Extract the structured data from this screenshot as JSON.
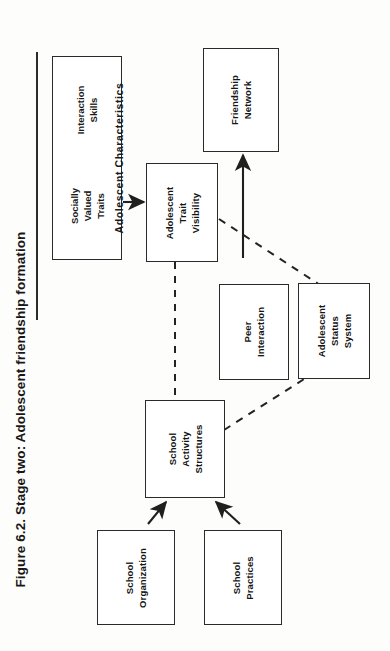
{
  "figure": {
    "caption": "Figure 6.2.   Stage two: Adolescent friendship formation",
    "orientation": "rotated-90-ccw",
    "page_width": 390,
    "page_height": 651,
    "ink_color": "#2a2a2a",
    "paper_color": "#fdfdfc"
  },
  "nodes": {
    "characteristics": {
      "header": "Adolescent Characteristics",
      "sub_a": "Socially\nValued\nTraits",
      "sub_a_lines": [
        "Socially",
        "Valued",
        "Traits"
      ],
      "sub_b": "Interaction\nSkills",
      "sub_b_lines": [
        "Interaction",
        "Skills"
      ]
    },
    "trait_visibility": {
      "label": "Adolescent\nTrait\nVisibility",
      "lines": [
        "Adolescent",
        "Trait",
        "Visibility"
      ]
    },
    "friendship_network": {
      "label": "Friendship\nNetwork",
      "lines": [
        "Friendship",
        "Network"
      ]
    },
    "peer_interaction": {
      "label": "Peer\nInteraction",
      "lines": [
        "Peer",
        "Interaction"
      ]
    },
    "status_system": {
      "label": "Adolescent\nStatus\nSystem",
      "lines": [
        "Adolescent",
        "Status",
        "System"
      ]
    },
    "activity_structures": {
      "label": "School\nActivity\nStructures",
      "lines": [
        "School",
        "Activity",
        "Structures"
      ]
    },
    "school_organization": {
      "label": "School\nOrganization",
      "lines": [
        "School",
        "Organization"
      ]
    },
    "school_practices": {
      "label": "School\nPractices",
      "lines": [
        "School",
        "Practices"
      ]
    }
  },
  "edges": [
    {
      "id": "char-to-trait",
      "from": "characteristics",
      "to": "trait_visibility",
      "style": "solid",
      "arrow": "single"
    },
    {
      "id": "peer-to-friendship",
      "from": "peer_interaction",
      "to": "friendship_network",
      "style": "solid",
      "arrow": "single"
    },
    {
      "id": "org-to-activity",
      "from": "school_organization",
      "to": "activity_structures",
      "style": "solid",
      "arrow": "single"
    },
    {
      "id": "practices-to-activity",
      "from": "school_practices",
      "to": "activity_structures",
      "style": "solid",
      "arrow": "single"
    },
    {
      "id": "trait-activity",
      "from": "trait_visibility",
      "to": "activity_structures",
      "style": "dashed",
      "arrow": "none"
    },
    {
      "id": "trait-status",
      "from": "trait_visibility",
      "to": "status_system",
      "style": "dashed",
      "arrow": "none"
    },
    {
      "id": "activity-status",
      "from": "activity_structures",
      "to": "status_system",
      "style": "dashed",
      "arrow": "none"
    }
  ]
}
